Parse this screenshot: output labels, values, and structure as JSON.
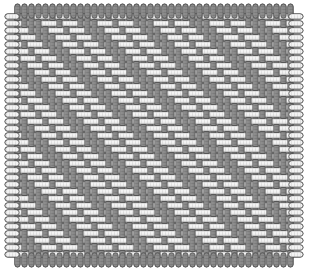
{
  "figure": {
    "kind": "weave-draft",
    "background_color": "#ffffff",
    "width_px": 314,
    "height_px": 277
  },
  "weave": {
    "warp_count": 40,
    "weft_count": 35,
    "cell_px": 7,
    "origin_x": 14,
    "origin_y": 13,
    "thread_width_px": 5.2,
    "overhang_px": 9,
    "warp_label": "warp-thread",
    "weft_label": "weft-thread",
    "colors": {
      "warp_fill": "#8a8a8a",
      "warp_stroke": "#4f4f4f",
      "warp_highlight": "#9e9e9e",
      "warp_shadow": "#6f6f6f",
      "weft_fill": "#f2f2f2",
      "weft_stroke": "#4f4f4f",
      "weft_highlight": "#fbfbfb",
      "weft_shadow": "#d0d0d0",
      "stripe_dark": "#6a6a6a",
      "stripe_light": "#c9c9c9",
      "background": "#ffffff"
    },
    "pattern": {
      "name": "broken-twill-float",
      "description": "Diagonal twill floats with periodic breaks; warp passes over weft where the pattern bit is 1.",
      "tile_size": 8,
      "tile": [
        [
          1,
          1,
          1,
          0,
          0,
          1,
          0,
          0
        ],
        [
          0,
          1,
          1,
          1,
          0,
          0,
          1,
          0
        ],
        [
          0,
          0,
          1,
          1,
          1,
          0,
          0,
          1
        ],
        [
          1,
          0,
          0,
          1,
          1,
          1,
          0,
          0
        ],
        [
          0,
          1,
          0,
          0,
          1,
          1,
          1,
          0
        ],
        [
          0,
          0,
          1,
          0,
          0,
          1,
          1,
          1
        ],
        [
          1,
          0,
          0,
          1,
          0,
          0,
          1,
          1
        ],
        [
          1,
          1,
          0,
          0,
          1,
          0,
          0,
          1
        ]
      ]
    }
  }
}
